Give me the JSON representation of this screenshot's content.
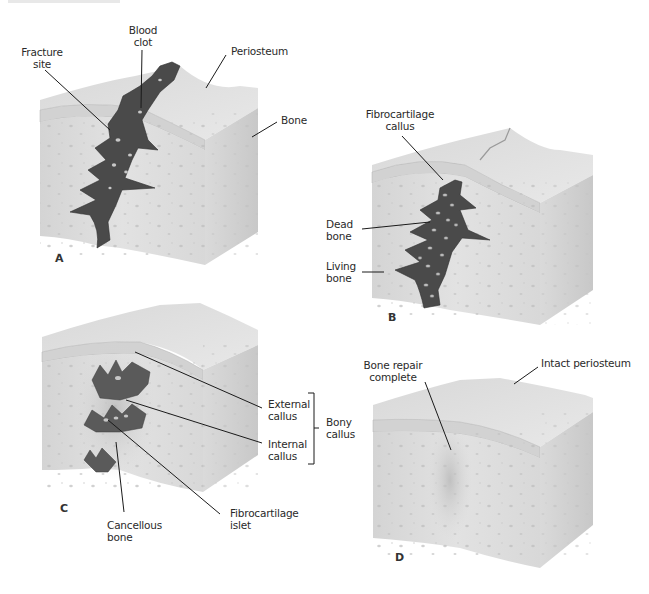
{
  "figure": {
    "title_fragment": "",
    "panels": [
      {
        "id": "A",
        "letter": "A",
        "labels": {
          "blood_clot": "Blood\nclot",
          "fracture_site": "Fracture\nsite",
          "periosteum": "Periosteum",
          "bone": "Bone"
        }
      },
      {
        "id": "B",
        "letter": "B",
        "labels": {
          "fibrocartilage_callus": "Fibrocartilage\ncallus",
          "dead_bone": "Dead\nbone",
          "living_bone": "Living\nbone"
        }
      },
      {
        "id": "C",
        "letter": "C",
        "labels": {
          "external_callus": "External\ncallus",
          "internal_callus": "Internal\ncallus",
          "bony_callus": "Bony\ncallus",
          "fibrocartilage_islet": "Fibrocartilage\nislet",
          "cancellous_bone": "Cancellous\nbone"
        }
      },
      {
        "id": "D",
        "letter": "D",
        "labels": {
          "bone_repair_complete": "Bone repair\ncomplete",
          "intact_periosteum": "Intact periosteum"
        }
      }
    ],
    "colors": {
      "bone_front": "#dcdcdc",
      "bone_right": "#cfcfcf",
      "bone_top": "#e4e4e4",
      "periosteum_band": "#d6d6d6",
      "clot": "#4a4a4a",
      "leader_line": "#1a1a1a"
    }
  }
}
